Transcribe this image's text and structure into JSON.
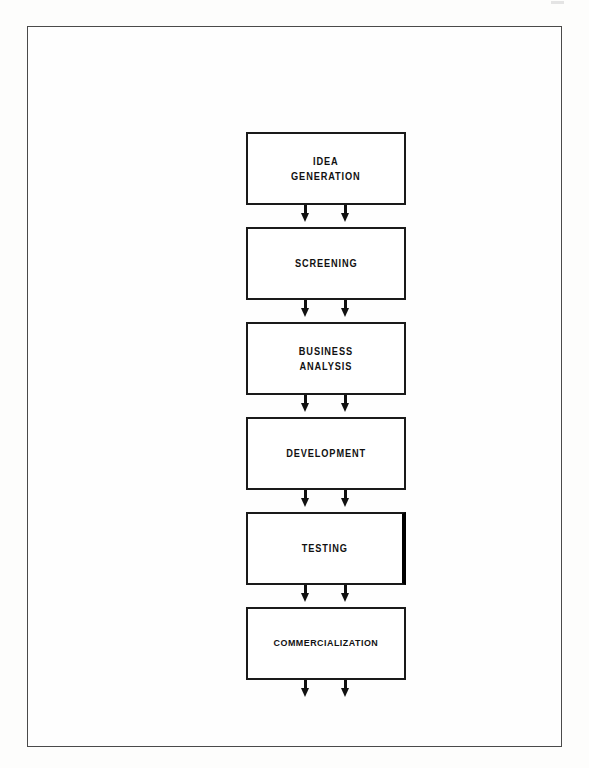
{
  "document": {
    "title": "New Product Development Process",
    "page_background": "#fdfdfc",
    "frame_color": "#4a4a4a",
    "ink_color": "#111111"
  },
  "chart_data": {
    "type": "diagram",
    "subtype": "vertical-flowchart",
    "orientation": "top-to-bottom",
    "node_count": 6,
    "connector_style": "double-arrow-down",
    "terminal_arrow": true,
    "nodes": [
      {
        "id": "idea-generation",
        "label": "IDEA\nGENERATION",
        "order": 1
      },
      {
        "id": "screening",
        "label": "SCREENING",
        "order": 2
      },
      {
        "id": "business-analysis",
        "label": "BUSINESS\nANALYSIS",
        "order": 3
      },
      {
        "id": "development",
        "label": "DEVELOPMENT",
        "order": 4
      },
      {
        "id": "testing",
        "label": "TESTING",
        "order": 5
      },
      {
        "id": "commercialization",
        "label": "COMMERCIALIZATION",
        "order": 6
      }
    ],
    "edges": [
      {
        "from": "idea-generation",
        "to": "screening"
      },
      {
        "from": "screening",
        "to": "business-analysis"
      },
      {
        "from": "business-analysis",
        "to": "development"
      },
      {
        "from": "development",
        "to": "testing"
      },
      {
        "from": "testing",
        "to": "commercialization"
      },
      {
        "from": "commercialization",
        "to": null
      }
    ]
  }
}
